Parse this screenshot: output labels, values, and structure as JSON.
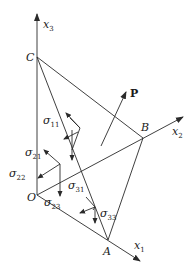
{
  "diagram": {
    "axes": [
      {
        "name": "x1",
        "base": "x",
        "sub": "1"
      },
      {
        "name": "x2",
        "base": "x",
        "sub": "2"
      },
      {
        "name": "x3",
        "base": "x",
        "sub": "3"
      }
    ],
    "points": {
      "O": "O",
      "A": "A",
      "B": "B",
      "C": "C"
    },
    "vector": {
      "label": "P"
    },
    "stresses": [
      {
        "id": "s11",
        "base": "σ",
        "sub": "11"
      },
      {
        "id": "s21",
        "base": "σ",
        "sub": "21"
      },
      {
        "id": "s22",
        "base": "σ",
        "sub": "22"
      },
      {
        "id": "s23",
        "base": "σ",
        "sub": "23"
      },
      {
        "id": "s31",
        "base": "σ",
        "sub": "31"
      },
      {
        "id": "s33",
        "base": "σ",
        "sub": "33"
      }
    ],
    "colors": {
      "line": "#2a2a2a",
      "text": "#1a1a1a",
      "background": "#ffffff"
    }
  }
}
